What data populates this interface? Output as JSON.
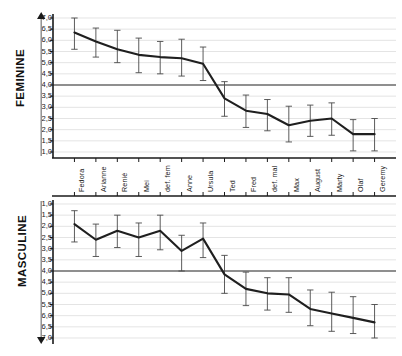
{
  "chart_data": [
    {
      "type": "line",
      "title": "",
      "ylabel": "FEMININE",
      "xlabel": "",
      "ylim": [
        1.0,
        7.0
      ],
      "y_inverted": false,
      "grid": true,
      "legend": "none",
      "reference_line": 4.0,
      "ytick_labels": [
        "7,0",
        "6,5",
        "6,0",
        "5,5",
        "5,0",
        "4,5",
        "4,0",
        "3,5",
        "3,0",
        "2,5",
        "2,0",
        "1,5",
        "1,0"
      ],
      "ytick_values": [
        7.0,
        6.5,
        6.0,
        5.5,
        5.0,
        4.5,
        4.0,
        3.5,
        3.0,
        2.5,
        2.0,
        1.5,
        1.0
      ],
      "axis_arrow": "up",
      "categories": [
        "Fedora",
        "Arianne",
        "Renié",
        "Mei",
        "def. fem",
        "Anne",
        "Ursula",
        "Ted",
        "Fred",
        "def. mal",
        "Max",
        "August",
        "Marty",
        "Olaf",
        "Geremy"
      ],
      "values": [
        6.35,
        5.95,
        5.6,
        5.35,
        5.25,
        5.2,
        4.95,
        3.4,
        2.85,
        2.7,
        2.2,
        2.4,
        2.5,
        1.8,
        1.8
      ],
      "error_upper": [
        7.0,
        6.55,
        6.45,
        6.1,
        5.95,
        6.05,
        5.7,
        4.15,
        3.55,
        3.35,
        3.05,
        3.1,
        3.2,
        2.45,
        2.5
      ],
      "error_lower": [
        5.6,
        5.25,
        5.0,
        4.55,
        4.5,
        4.4,
        4.2,
        2.6,
        2.1,
        1.95,
        1.45,
        1.7,
        1.75,
        1.05,
        1.05
      ]
    },
    {
      "type": "line",
      "title": "",
      "ylabel": "MASCULINE",
      "xlabel": "",
      "ylim": [
        1.0,
        7.0
      ],
      "y_inverted": true,
      "grid": true,
      "legend": "none",
      "reference_line": 4.0,
      "ytick_labels": [
        "1,0",
        "1,5",
        "2,0",
        "2,5",
        "3,0",
        "3,5",
        "4,0",
        "4,5",
        "5,0",
        "5,5",
        "6,0",
        "6,5",
        "7,0"
      ],
      "ytick_values": [
        1.0,
        1.5,
        2.0,
        2.5,
        3.0,
        3.5,
        4.0,
        4.5,
        5.0,
        5.5,
        6.0,
        6.5,
        7.0
      ],
      "axis_arrow": "down",
      "categories": [
        "Fedora",
        "Arianne",
        "Renié",
        "Mei",
        "def. fem",
        "Anne",
        "Ursula",
        "Ted",
        "Fred",
        "def. mal",
        "Max",
        "August",
        "Marty",
        "Olaf",
        "Geremy"
      ],
      "values": [
        1.9,
        2.6,
        2.2,
        2.5,
        2.2,
        3.1,
        2.55,
        4.15,
        4.8,
        5.0,
        5.05,
        5.7,
        5.9,
        6.1,
        6.3
      ],
      "error_upper": [
        1.3,
        1.9,
        1.5,
        1.85,
        1.5,
        2.4,
        1.85,
        3.3,
        4.05,
        4.3,
        4.3,
        4.85,
        4.95,
        5.15,
        5.5
      ],
      "error_lower": [
        2.7,
        3.35,
        2.95,
        3.35,
        3.05,
        4.0,
        3.4,
        5.0,
        5.55,
        5.75,
        5.85,
        6.45,
        6.7,
        6.8,
        7.0
      ]
    }
  ],
  "panels": {
    "feminine": {
      "name": "FEMININE"
    },
    "masculine": {
      "name": "MASCULINE"
    }
  }
}
